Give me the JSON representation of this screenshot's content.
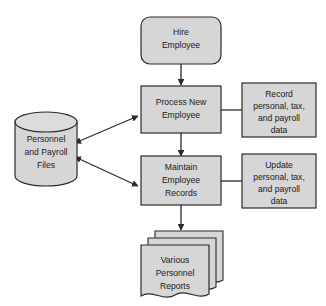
{
  "diagram": {
    "background_color": "#ffffff",
    "shape_fill_color": "#d6d6d6",
    "shape_stroke_color": "#2b2b2b",
    "text_color": "#1a1a1a",
    "nodes": {
      "hire_employee": {
        "shape": "rounded-rectangle",
        "lines": [
          "Hire",
          "Employee"
        ]
      },
      "process_new_employee": {
        "shape": "rectangle",
        "lines": [
          "Process New",
          "Employee"
        ]
      },
      "record_data": {
        "shape": "rectangle",
        "lines": [
          "Record",
          "personal, tax,",
          "and payroll",
          "data"
        ]
      },
      "maintain_employee_records": {
        "shape": "rectangle",
        "lines": [
          "Maintain",
          "Employee",
          "Records"
        ]
      },
      "update_data": {
        "shape": "rectangle",
        "lines": [
          "Update",
          "personal, tax,",
          "and payroll",
          "data"
        ]
      },
      "personnel_payroll_files": {
        "shape": "cylinder-database",
        "lines": [
          "Personnel",
          "and Payroll",
          "Files"
        ]
      },
      "various_personnel_reports": {
        "shape": "stacked-documents",
        "lines": [
          "Various",
          "Personnel",
          "Reports"
        ]
      }
    },
    "connectors": [
      {
        "name": "hire-to-process",
        "from": "hire_employee",
        "to": "process_new_employee",
        "style": "arrow-down",
        "heads": 1
      },
      {
        "name": "process-to-record",
        "from": "process_new_employee",
        "to": "record_data",
        "style": "plain-line",
        "heads": 0
      },
      {
        "name": "process-to-files",
        "from": "process_new_employee",
        "to": "personnel_payroll_files",
        "style": "double-arrow-diagonal",
        "heads": 2
      },
      {
        "name": "process-to-maintain",
        "from": "process_new_employee",
        "to": "maintain_employee_records",
        "style": "arrow-down",
        "heads": 1
      },
      {
        "name": "maintain-to-update",
        "from": "maintain_employee_records",
        "to": "update_data",
        "style": "plain-line",
        "heads": 0
      },
      {
        "name": "maintain-to-files",
        "from": "maintain_employee_records",
        "to": "personnel_payroll_files",
        "style": "double-arrow-diagonal",
        "heads": 2
      },
      {
        "name": "maintain-to-reports",
        "from": "maintain_employee_records",
        "to": "various_personnel_reports",
        "style": "arrow-down",
        "heads": 1
      }
    ]
  }
}
